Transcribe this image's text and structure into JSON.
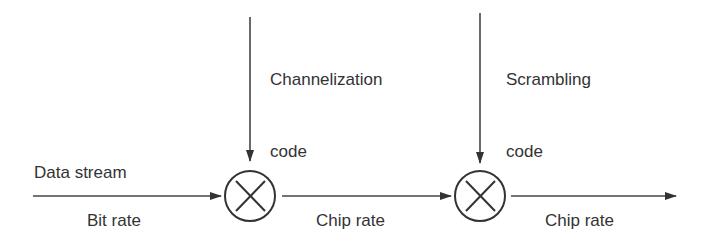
{
  "diagram": {
    "inputs": {
      "data_stream": "Data stream",
      "channelization_code_line1": "Channelization",
      "channelization_code_line2": "code",
      "scrambling_code_line1": "Scrambling",
      "scrambling_code_line2": "code"
    },
    "rates": {
      "input_rate": "Bit rate",
      "middle_rate": "Chip rate",
      "output_rate": "Chip rate"
    },
    "nodes": [
      {
        "id": "multiplier-1",
        "symbol": "⊗",
        "input": "Channelization code"
      },
      {
        "id": "multiplier-2",
        "symbol": "⊗",
        "input": "Scrambling code"
      }
    ],
    "colors": {
      "stroke": "#333333",
      "text": "#333333",
      "background": "#ffffff"
    }
  }
}
